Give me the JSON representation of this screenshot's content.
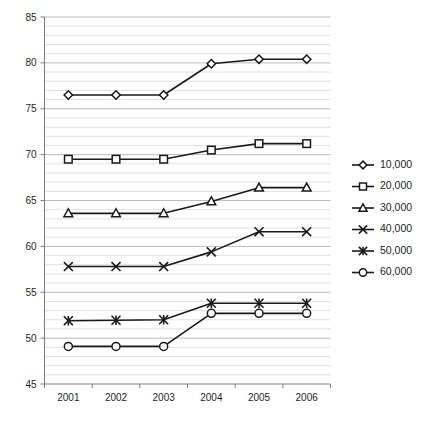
{
  "chart_data": {
    "type": "line",
    "title": "",
    "subtitle": "",
    "xlabel": "",
    "ylabel": "",
    "categories": [
      "2001",
      "2002",
      "2003",
      "2004",
      "2005",
      "2006"
    ],
    "x": [
      2001,
      2002,
      2003,
      2004,
      2005,
      2006
    ],
    "ylim": [
      45,
      85
    ],
    "xlim": [
      2000.6,
      2006.5
    ],
    "y_major_ticks": [
      45,
      50,
      55,
      60,
      65,
      70,
      75,
      80,
      85
    ],
    "y_minor_step": 1,
    "grid": true,
    "grid_axis": "y",
    "legend_position": "right",
    "series": [
      {
        "name": "10,000",
        "marker": "diamond",
        "values": [
          76.5,
          76.5,
          76.5,
          79.9,
          80.4,
          80.4
        ]
      },
      {
        "name": "20,000",
        "marker": "square",
        "values": [
          69.5,
          69.5,
          69.5,
          70.5,
          71.2,
          71.2
        ]
      },
      {
        "name": "30,000",
        "marker": "triangle",
        "values": [
          63.6,
          63.6,
          63.6,
          64.9,
          66.4,
          66.4
        ]
      },
      {
        "name": "40,000",
        "marker": "cross",
        "values": [
          57.8,
          57.8,
          57.8,
          59.4,
          61.6,
          61.6
        ]
      },
      {
        "name": "50,000",
        "marker": "asterisk",
        "values": [
          51.9,
          51.95,
          52.0,
          53.8,
          53.8,
          53.8
        ]
      },
      {
        "name": "60,000",
        "marker": "circle",
        "values": [
          49.1,
          49.1,
          49.1,
          52.7,
          52.7,
          52.7
        ]
      }
    ]
  },
  "colors": {
    "line": "#1a1a1a",
    "grid_minor": "#d4d4d4",
    "grid_major": "#a9a9a9",
    "axis": "#808080",
    "text": "#231f20",
    "background": "#ffffff"
  },
  "legend": {
    "entries": [
      {
        "label": "10,000",
        "marker": "diamond-icon"
      },
      {
        "label": "20,000",
        "marker": "square-icon"
      },
      {
        "label": "30,000",
        "marker": "triangle-icon"
      },
      {
        "label": "40,000",
        "marker": "cross-icon"
      },
      {
        "label": "50,000",
        "marker": "asterisk-icon"
      },
      {
        "label": "60,000",
        "marker": "circle-icon"
      }
    ]
  },
  "axes": {
    "y_tick_labels": [
      "85",
      "80",
      "75",
      "70",
      "65",
      "60",
      "55",
      "50",
      "45"
    ],
    "x_tick_labels": [
      "2001",
      "2002",
      "2003",
      "2004",
      "2005",
      "2006"
    ]
  }
}
